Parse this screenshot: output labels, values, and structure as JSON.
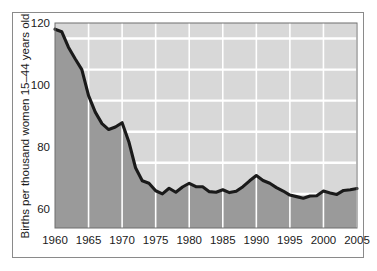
{
  "figure": {
    "background_color": "#ffffff",
    "frame_color": "#8a8a8a"
  },
  "chart_data": {
    "type": "area",
    "title": "",
    "subtitle": "",
    "xlabel": "",
    "ylabel": "Births per thousand women 15–44 years old",
    "xlim": [
      1960,
      2005
    ],
    "ylim": [
      54,
      120
    ],
    "y_tick_labels": [
      "120",
      "100",
      "80",
      "60"
    ],
    "y_ticks": [
      120,
      100,
      80,
      60
    ],
    "gridlines_y": [
      115,
      105,
      95,
      85,
      75,
      65
    ],
    "grid": true,
    "grid_color": "#ffffff",
    "x_tick_labels": [
      "1960",
      "1965",
      "1970",
      "1975",
      "1980",
      "1985",
      "1990",
      "1995",
      "2000",
      "2005"
    ],
    "x_ticks": [
      1960,
      1965,
      1970,
      1975,
      1980,
      1985,
      1990,
      1995,
      2000,
      2005
    ],
    "legend": null,
    "legend_position": "none",
    "series_name": "General fertility rate",
    "line_color": "#1a1a1a",
    "fill_color": "#9a9a9a",
    "plot_background_color": "#d8d8d8",
    "x": [
      1960,
      1961,
      1962,
      1963,
      1964,
      1965,
      1966,
      1967,
      1968,
      1969,
      1970,
      1971,
      1972,
      1973,
      1974,
      1975,
      1976,
      1977,
      1978,
      1979,
      1980,
      1981,
      1982,
      1983,
      1984,
      1985,
      1986,
      1987,
      1988,
      1989,
      1990,
      1991,
      1992,
      1993,
      1994,
      1995,
      1996,
      1997,
      1998,
      1999,
      2000,
      2001,
      2002,
      2003,
      2004,
      2005
    ],
    "values": [
      118.0,
      117.2,
      112.2,
      108.5,
      105.0,
      96.6,
      91.3,
      87.6,
      85.7,
      86.5,
      87.9,
      81.8,
      73.4,
      69.2,
      68.4,
      66.0,
      65.0,
      66.8,
      65.5,
      67.2,
      68.4,
      67.3,
      67.3,
      65.7,
      65.5,
      66.3,
      65.4,
      65.8,
      67.3,
      69.2,
      70.9,
      69.3,
      68.4,
      67.0,
      65.9,
      64.6,
      64.1,
      63.6,
      64.3,
      64.4,
      65.9,
      65.3,
      64.8,
      66.1,
      66.3,
      66.7
    ]
  }
}
